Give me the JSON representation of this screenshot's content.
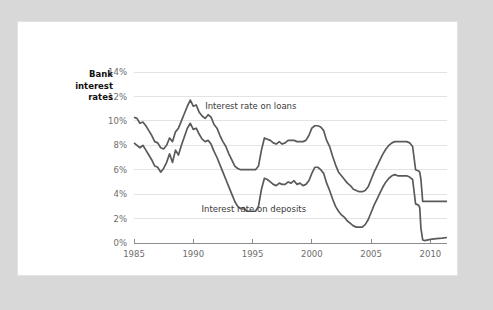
{
  "card": {
    "title_lines": [
      "Bank",
      "interest",
      "rates"
    ],
    "title_text": "Bank interest rates"
  },
  "colors": {
    "page_background": "#d8d8d8",
    "card_background": "#ffffff",
    "line": "#5a5a5a",
    "gridline": "#e3e3e3",
    "axis": "#8d8d8d",
    "tick_text": "#6d6d6d",
    "title_text": "#111111"
  },
  "chart_data": {
    "type": "line",
    "xlabel": "",
    "ylabel": "",
    "grid": true,
    "legend_position": "inline-annotation",
    "xlim": [
      1985,
      2011.4
    ],
    "ylim": [
      0,
      14
    ],
    "ytick_labels": [
      "0%",
      "2%",
      "4%",
      "6%",
      "8%",
      "10%",
      "12%",
      "14%"
    ],
    "ytick_values": [
      0,
      2,
      4,
      6,
      8,
      10,
      12,
      14
    ],
    "xtick_labels": [
      "1985",
      "1990",
      "1995",
      "2000",
      "2005",
      "2010"
    ],
    "xtick_values": [
      1985,
      1990,
      1995,
      2000,
      2005,
      2010
    ],
    "annotations": [
      {
        "text": "Interest rate on loans",
        "x": 1991.0,
        "y": 11.0
      },
      {
        "text": "Interest rate on deposits",
        "x": 1990.7,
        "y": 2.55
      }
    ],
    "series": [
      {
        "name": "Interest rate on loans",
        "label": "Interest rate on loans",
        "x": [
          1985.0,
          1985.25,
          1985.5,
          1985.75,
          1986.0,
          1986.25,
          1986.5,
          1986.75,
          1987.0,
          1987.25,
          1987.5,
          1987.75,
          1988.0,
          1988.25,
          1988.5,
          1988.75,
          1989.0,
          1989.25,
          1989.5,
          1989.75,
          1990.0,
          1990.25,
          1990.5,
          1990.75,
          1991.0,
          1991.25,
          1991.5,
          1991.75,
          1992.0,
          1992.25,
          1992.5,
          1992.75,
          1993.0,
          1993.25,
          1993.5,
          1993.75,
          1994.0,
          1994.25,
          1994.5,
          1994.75,
          1995.0,
          1995.25,
          1995.5,
          1995.75,
          1996.0,
          1996.25,
          1996.5,
          1996.75,
          1997.0,
          1997.25,
          1997.5,
          1997.75,
          1998.0,
          1998.25,
          1998.5,
          1998.75,
          1999.0,
          1999.25,
          1999.5,
          1999.75,
          2000.0,
          2000.25,
          2000.5,
          2000.75,
          2001.0,
          2001.25,
          2001.5,
          2001.75,
          2002.0,
          2002.25,
          2002.5,
          2002.75,
          2003.0,
          2003.25,
          2003.5,
          2003.75,
          2004.0,
          2004.25,
          2004.5,
          2004.75,
          2005.0,
          2005.25,
          2005.5,
          2005.75,
          2006.0,
          2006.25,
          2006.5,
          2006.75,
          2007.0,
          2007.25,
          2007.5,
          2007.75,
          2008.0,
          2008.25,
          2008.5,
          2008.75,
          2009.0,
          2009.1,
          2009.2,
          2009.35,
          2009.5,
          2010.0,
          2010.5,
          2011.0,
          2011.4
        ],
        "y": [
          10.3,
          10.2,
          9.8,
          9.9,
          9.6,
          9.2,
          8.8,
          8.3,
          8.2,
          7.8,
          7.7,
          8.0,
          8.6,
          8.3,
          9.1,
          9.4,
          10.0,
          10.6,
          11.2,
          11.7,
          11.2,
          11.3,
          10.7,
          10.4,
          10.2,
          10.5,
          10.3,
          9.7,
          9.4,
          8.8,
          8.3,
          7.9,
          7.3,
          6.8,
          6.3,
          6.1,
          6.0,
          6.0,
          6.0,
          6.0,
          6.0,
          6.0,
          6.3,
          7.6,
          8.6,
          8.5,
          8.4,
          8.2,
          8.1,
          8.3,
          8.1,
          8.2,
          8.4,
          8.4,
          8.4,
          8.3,
          8.3,
          8.3,
          8.4,
          8.8,
          9.4,
          9.6,
          9.6,
          9.5,
          9.2,
          8.4,
          7.9,
          7.1,
          6.4,
          5.8,
          5.5,
          5.2,
          4.9,
          4.7,
          4.4,
          4.3,
          4.2,
          4.2,
          4.3,
          4.6,
          5.2,
          5.8,
          6.3,
          6.8,
          7.3,
          7.7,
          8.0,
          8.2,
          8.3,
          8.3,
          8.3,
          8.3,
          8.3,
          8.2,
          7.9,
          6.0,
          5.9,
          5.8,
          5.2,
          3.4,
          3.4,
          3.4,
          3.4,
          3.4,
          3.4
        ]
      },
      {
        "name": "Interest rate on deposits",
        "label": "Interest rate on deposits",
        "x": [
          1985.0,
          1985.25,
          1985.5,
          1985.75,
          1986.0,
          1986.25,
          1986.5,
          1986.75,
          1987.0,
          1987.25,
          1987.5,
          1987.75,
          1988.0,
          1988.25,
          1988.5,
          1988.75,
          1989.0,
          1989.25,
          1989.5,
          1989.75,
          1990.0,
          1990.25,
          1990.5,
          1990.75,
          1991.0,
          1991.25,
          1991.5,
          1991.75,
          1992.0,
          1992.25,
          1992.5,
          1992.75,
          1993.0,
          1993.25,
          1993.5,
          1993.75,
          1994.0,
          1994.25,
          1994.5,
          1994.75,
          1995.0,
          1995.25,
          1995.5,
          1995.75,
          1996.0,
          1996.25,
          1996.5,
          1996.75,
          1997.0,
          1997.25,
          1997.5,
          1997.75,
          1998.0,
          1998.25,
          1998.5,
          1998.75,
          1999.0,
          1999.25,
          1999.5,
          1999.75,
          2000.0,
          2000.25,
          2000.5,
          2000.75,
          2001.0,
          2001.25,
          2001.5,
          2001.75,
          2002.0,
          2002.25,
          2002.5,
          2002.75,
          2003.0,
          2003.25,
          2003.5,
          2003.75,
          2004.0,
          2004.25,
          2004.5,
          2004.75,
          2005.0,
          2005.25,
          2005.5,
          2005.75,
          2006.0,
          2006.25,
          2006.5,
          2006.75,
          2007.0,
          2007.25,
          2007.5,
          2007.75,
          2008.0,
          2008.25,
          2008.5,
          2008.75,
          2009.0,
          2009.1,
          2009.2,
          2009.35,
          2009.5,
          2010.0,
          2010.5,
          2011.0,
          2011.4
        ],
        "y": [
          8.2,
          8.0,
          7.8,
          8.0,
          7.6,
          7.2,
          6.8,
          6.3,
          6.2,
          5.8,
          6.1,
          6.6,
          7.3,
          6.6,
          7.6,
          7.2,
          8.0,
          8.7,
          9.4,
          9.8,
          9.3,
          9.4,
          8.9,
          8.5,
          8.3,
          8.4,
          8.1,
          7.5,
          7.0,
          6.4,
          5.8,
          5.2,
          4.6,
          4.0,
          3.4,
          3.0,
          2.8,
          2.9,
          2.6,
          2.6,
          2.6,
          2.6,
          3.0,
          4.4,
          5.3,
          5.2,
          5.0,
          4.8,
          4.7,
          4.9,
          4.8,
          4.8,
          5.0,
          4.9,
          5.1,
          4.8,
          4.9,
          4.7,
          4.8,
          5.1,
          5.7,
          6.2,
          6.2,
          6.0,
          5.7,
          4.9,
          4.3,
          3.6,
          3.0,
          2.6,
          2.3,
          2.1,
          1.8,
          1.6,
          1.4,
          1.3,
          1.3,
          1.3,
          1.5,
          1.9,
          2.5,
          3.1,
          3.6,
          4.1,
          4.6,
          5.0,
          5.3,
          5.5,
          5.6,
          5.5,
          5.5,
          5.5,
          5.5,
          5.4,
          5.2,
          3.2,
          3.1,
          2.9,
          1.2,
          0.25,
          0.2,
          0.3,
          0.35,
          0.4,
          0.45
        ]
      }
    ]
  }
}
